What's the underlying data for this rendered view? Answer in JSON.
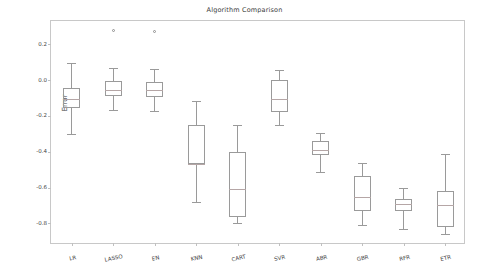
{
  "chart_data": {
    "type": "box",
    "title": "Algorithm Comparison",
    "xlabel": "",
    "ylabel": "Error",
    "ylim": [
      -0.92,
      0.33
    ],
    "yticks": [
      0.2,
      0.0,
      -0.2,
      -0.4,
      -0.6,
      -0.8
    ],
    "ytick_labels": [
      "0.2",
      "0.0",
      "-0.2",
      "-0.4",
      "-0.6",
      "-0.8"
    ],
    "grid": false,
    "legend": null,
    "categories": [
      "LR",
      "LASSO",
      "EN",
      "KNN",
      "CART",
      "SVR",
      "ABR",
      "GBR",
      "RFR",
      "ETR"
    ],
    "boxes": [
      {
        "label": "LR",
        "whisker_low": -0.3,
        "q1": -0.155,
        "median": -0.105,
        "q3": -0.045,
        "whisker_high": 0.095,
        "fliers": []
      },
      {
        "label": "LASSO",
        "whisker_low": -0.165,
        "q1": -0.09,
        "median": -0.053,
        "q3": -0.007,
        "whisker_high": 0.065,
        "fliers": [
          0.277
        ]
      },
      {
        "label": "EN",
        "whisker_low": -0.172,
        "q1": -0.095,
        "median": -0.055,
        "q3": -0.013,
        "whisker_high": 0.06,
        "fliers": [
          0.272
        ]
      },
      {
        "label": "KNN",
        "whisker_low": -0.678,
        "q1": -0.468,
        "median": -0.468,
        "q3": -0.253,
        "whisker_high": -0.115,
        "fliers": []
      },
      {
        "label": "CART",
        "whisker_low": -0.795,
        "q1": -0.765,
        "median": -0.608,
        "q3": -0.4,
        "whisker_high": -0.252,
        "fliers": []
      },
      {
        "label": "SVR",
        "whisker_low": -0.248,
        "q1": -0.178,
        "median": -0.108,
        "q3": -0.002,
        "whisker_high": 0.055,
        "fliers": []
      },
      {
        "label": "ABR",
        "whisker_low": -0.512,
        "q1": -0.415,
        "median": -0.388,
        "q3": -0.342,
        "whisker_high": -0.295,
        "fliers": []
      },
      {
        "label": "GBR",
        "whisker_low": -0.81,
        "q1": -0.73,
        "median": -0.65,
        "q3": -0.537,
        "whisker_high": -0.462,
        "fliers": []
      },
      {
        "label": "RFR",
        "whisker_low": -0.828,
        "q1": -0.733,
        "median": -0.69,
        "q3": -0.663,
        "whisker_high": -0.602,
        "fliers": []
      },
      {
        "label": "ETR",
        "whisker_low": -0.86,
        "q1": -0.818,
        "median": -0.697,
        "q3": -0.618,
        "whisker_high": -0.412,
        "fliers": []
      }
    ],
    "style": {
      "line_color": "#9a9a9a",
      "median_color": "#b5a6a6",
      "frame_color": "#c8c8c8",
      "text_color": "#3c3c3c",
      "background": "#ffffff"
    }
  }
}
